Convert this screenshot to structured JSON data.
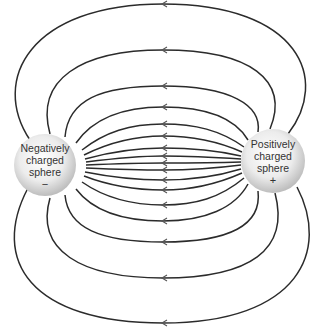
{
  "spheres": {
    "negative": {
      "line1": "Negatively",
      "line2": "charged",
      "line3": "sphere",
      "sign": "−",
      "cx": 45,
      "cy": 165,
      "r": 31
    },
    "positive": {
      "line1": "Positively",
      "line2": "charged",
      "line3": "sphere",
      "sign": "+",
      "cx": 273,
      "cy": 161,
      "r": 32
    }
  },
  "field_lines": {
    "count": 17,
    "arrow_direction": "positive-to-negative",
    "midline_crossings_y": [
      4,
      50,
      86,
      107,
      124,
      136,
      148,
      156,
      163,
      170,
      180,
      190,
      205,
      221,
      242,
      278,
      323
    ]
  },
  "colors": {
    "line": "#2b2b2b",
    "sphere_light": "#ffffff",
    "sphere_dark": "#bdbdbd",
    "text": "#333333"
  }
}
